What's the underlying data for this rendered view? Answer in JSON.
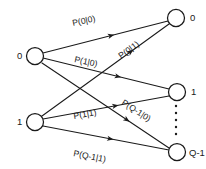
{
  "figure": {
    "background_color": "#ffffff",
    "ink_color": "#1a1a1a",
    "width": 206,
    "height": 169
  },
  "input_nodes": [
    {
      "id": "in-0",
      "label": "0",
      "cx": 35,
      "cy": 56,
      "r": 8.5,
      "label_x": 17,
      "label_y": 59
    },
    {
      "id": "in-1",
      "label": "1",
      "cx": 35,
      "cy": 122,
      "r": 8.5,
      "label_x": 17,
      "label_y": 125
    }
  ],
  "output_nodes": [
    {
      "id": "out-0",
      "label": "0",
      "cx": 176,
      "cy": 18,
      "r": 8.5,
      "label_x": 190,
      "label_y": 21
    },
    {
      "id": "out-1",
      "label": "1",
      "cx": 177,
      "cy": 92,
      "r": 8.5,
      "label_x": 191,
      "label_y": 95
    },
    {
      "id": "out-q1",
      "label": "Q-1",
      "cx": 177,
      "cy": 152,
      "r": 8.5,
      "label_x": 189,
      "label_y": 156
    }
  ],
  "edges": [
    {
      "id": "edge-0-0",
      "label": "P(0|0)",
      "from": "in-0",
      "to": "out-0",
      "x1": 43,
      "y1": 53,
      "x2": 168,
      "y2": 21,
      "arrow_t": 0.57,
      "arrow_angle": -14,
      "label_x": 73,
      "label_y": 26,
      "label_rot": -12
    },
    {
      "id": "edge-0-1",
      "label": "P(1|0)",
      "from": "in-0",
      "to": "out-1",
      "x1": 43,
      "y1": 58,
      "x2": 169,
      "y2": 89,
      "arrow_t": 0.62,
      "arrow_angle": 14,
      "label_x": 74,
      "label_y": 62,
      "label_rot": 12
    },
    {
      "id": "edge-0-q1",
      "label": "P(Q-1|0)",
      "from": "in-0",
      "to": "out-q1",
      "x1": 42,
      "y1": 63,
      "x2": 169,
      "y2": 148,
      "arrow_t": 0.69,
      "arrow_angle": 33,
      "label_x": 121,
      "label_y": 104,
      "label_rot": 33
    },
    {
      "id": "edge-1-0",
      "label": "P(0|1)",
      "from": "in-1",
      "to": "out-0",
      "x1": 42,
      "y1": 116,
      "x2": 169,
      "y2": 24,
      "arrow_t": 0.72,
      "arrow_angle": -36,
      "label_x": 121,
      "label_y": 59,
      "label_rot": -36
    },
    {
      "id": "edge-1-1",
      "label": "P(1|1)",
      "from": "in-1",
      "to": "out-1",
      "x1": 43,
      "y1": 119,
      "x2": 169,
      "y2": 96,
      "arrow_t": 0.6,
      "arrow_angle": -10,
      "label_x": 74,
      "label_y": 119,
      "label_rot": -10
    },
    {
      "id": "edge-1-q1",
      "label": "P(Q-1|1)",
      "from": "in-1",
      "to": "out-q1",
      "x1": 43,
      "y1": 126,
      "x2": 169,
      "y2": 150,
      "arrow_t": 0.56,
      "arrow_angle": 11,
      "label_x": 73,
      "label_y": 156,
      "label_rot": 11
    }
  ],
  "ellipsis": {
    "name": "vertical-ellipsis",
    "x": 176,
    "dots_y": [
      106,
      113,
      120,
      127,
      134
    ],
    "radius": 1.2
  }
}
